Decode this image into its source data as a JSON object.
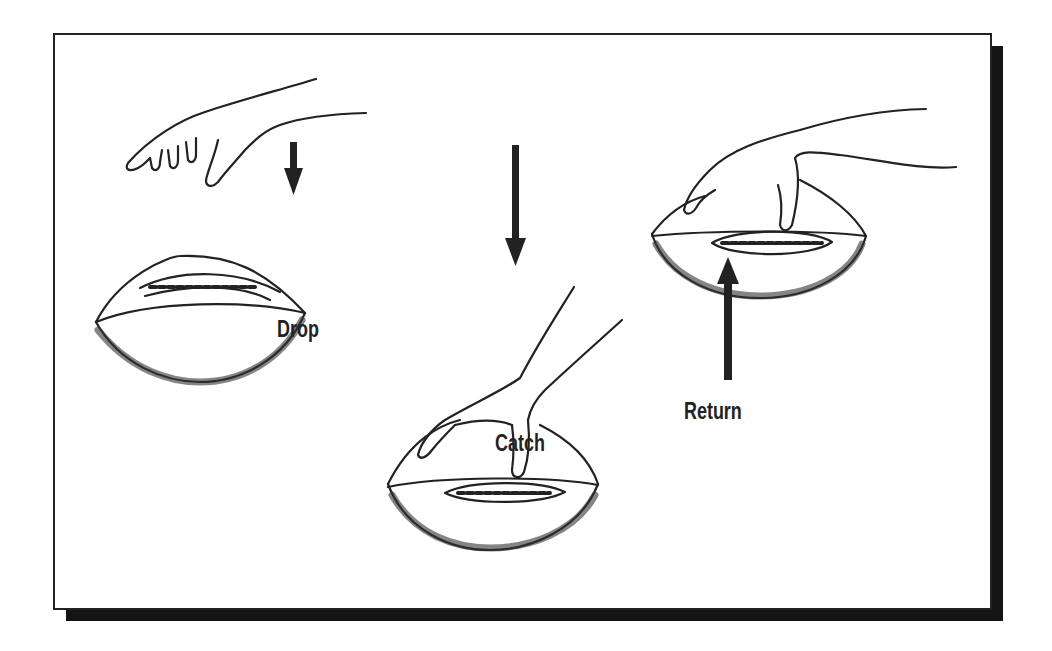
{
  "diagram": {
    "title": "",
    "steps": [
      {
        "label": "Drop",
        "description": "hand releases football, arrow pointing down"
      },
      {
        "label": "Catch",
        "description": "hand catches football from above"
      },
      {
        "label": "Return",
        "description": "hand holding football, arrow pointing up"
      }
    ],
    "colors": {
      "ink": "#222222",
      "shadow": "#141414",
      "background": "#ffffff"
    }
  }
}
